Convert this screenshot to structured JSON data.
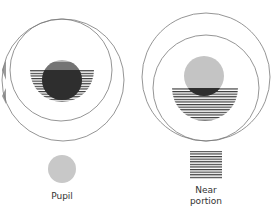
{
  "figures": [
    {
      "name": "distance-view",
      "description": "lens over pupil, distance position"
    },
    {
      "name": "near-view",
      "description": "lens over pupil, near position"
    }
  ],
  "legend": {
    "pupil_label": "Pupil",
    "near_label_line1": "Near",
    "near_label_line2": "portion"
  },
  "colors": {
    "outline": "#7a7a7a",
    "pupil_fill": "#c8c8c8",
    "stripe": "#3a3a3a",
    "overlap": "#2a2a2a"
  }
}
